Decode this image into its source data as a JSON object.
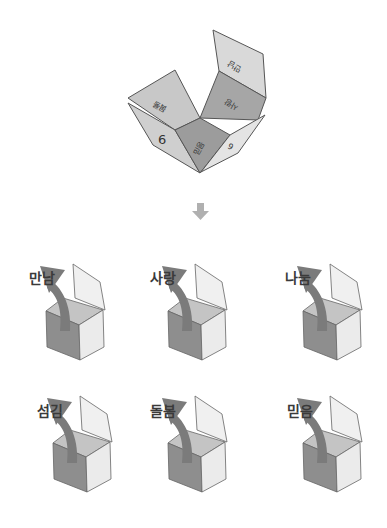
{
  "net": {
    "faces": {
      "top_flap": "만남",
      "upper_right": "사랑",
      "upper_left": "돌봄",
      "bottom_center": "믿음",
      "left_number": "6",
      "right_number": "6"
    }
  },
  "arrow_icon": "down-arrow",
  "boxes": [
    {
      "label": "만남"
    },
    {
      "label": "사랑"
    },
    {
      "label": "나눔"
    },
    {
      "label": "섬김"
    },
    {
      "label": "돌봄"
    },
    {
      "label": "믿음"
    }
  ],
  "colors": {
    "dark_face": "#8e8e8e",
    "mid_face": "#c2c2c2",
    "light_face": "#e8e8e8",
    "arrow": "#7b7b7b",
    "outline": "#555555"
  }
}
